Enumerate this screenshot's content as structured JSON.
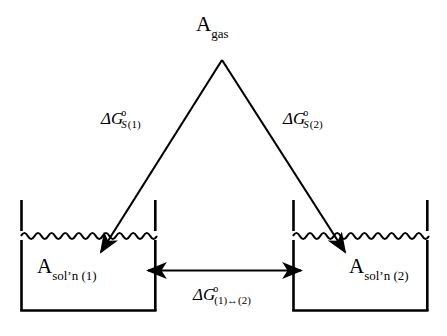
{
  "diagram": {
    "type": "thermodynamic-cycle",
    "background_color": "#ffffff",
    "stroke_color": "#000000"
  },
  "nodes": {
    "gas": {
      "base": "A",
      "subscript": "gas",
      "full_text": "A_gas",
      "position": "top-center"
    },
    "solution_1": {
      "base": "A",
      "subscript": "sol’n (1)",
      "full_text": "A_sol’n (1)",
      "position": "bottom-left"
    },
    "solution_2": {
      "base": "A",
      "subscript": "sol’n (2)",
      "full_text": "A_sol’n (2)",
      "position": "bottom-right"
    }
  },
  "arrows": {
    "gas_to_solution_1": {
      "symbol": "ΔG",
      "superscript": "o",
      "subscript_italic": "S",
      "subscript_plain": "(1)",
      "full_text": "ΔG°_S(1)",
      "direction": "gas → sol’n (1)",
      "head": "single"
    },
    "gas_to_solution_2": {
      "symbol": "ΔG",
      "superscript": "o",
      "subscript_italic": "S",
      "subscript_plain": "(2)",
      "full_text": "ΔG°_S(2)",
      "direction": "gas → sol’n (2)",
      "head": "single"
    },
    "solution_1_to_solution_2": {
      "symbol": "ΔG",
      "superscript": "o",
      "subscript_italic": "",
      "subscript_plain": "(1)↔(2)",
      "full_text": "ΔG°_(1)↔(2)",
      "direction": "sol’n (1) ↔ sol’n (2)",
      "head": "double"
    }
  },
  "beakers": [
    {
      "name": "beaker-left",
      "contains": "A_sol’n (1)",
      "liquid_surface": "wavy"
    },
    {
      "name": "beaker-right",
      "contains": "A_sol’n (2)",
      "liquid_surface": "wavy"
    }
  ]
}
